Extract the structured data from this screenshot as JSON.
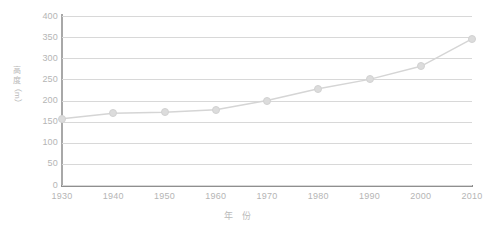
{
  "chart_data": {
    "type": "line",
    "title": "",
    "xlabel": "年 份",
    "ylabel": "高度（m）",
    "ylabel_chars": [
      "高",
      "度"
    ],
    "ylabel_unit": "（m）",
    "categories": [
      1930,
      1940,
      1950,
      1960,
      1970,
      1980,
      1990,
      2000,
      2010
    ],
    "xtick_labels": [
      "1930",
      "1940",
      "1950",
      "1960",
      "1970",
      "1980",
      "1990",
      "2000",
      "2010"
    ],
    "values": [
      157,
      170,
      172,
      178,
      200,
      228,
      250,
      281,
      346
    ],
    "series": [
      {
        "name": "高度",
        "values": [
          157,
          170,
          172,
          178,
          200,
          228,
          250,
          281,
          346
        ]
      }
    ],
    "ylim": [
      0,
      400
    ],
    "ytick_labels": [
      "0",
      "50",
      "100",
      "150",
      "200",
      "250",
      "300",
      "350",
      "400"
    ],
    "ytick_values": [
      0,
      50,
      100,
      150,
      200,
      250,
      300,
      350,
      400
    ],
    "xlim": [
      1930,
      2010
    ],
    "grid": "horizontal",
    "legend": "none",
    "colors": {
      "line": "#d5d5d5",
      "marker": "#dcdcdc",
      "marker_border": "#d2d2d2",
      "gridline": "#d8d8d8",
      "axis": "#8f8f8f",
      "text": "#b5b5b5",
      "background": "#ffffff"
    }
  }
}
